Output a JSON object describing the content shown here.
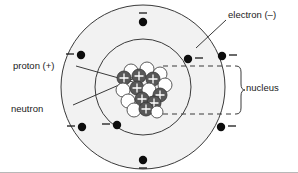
{
  "figure": {
    "background_color": "#ffffff",
    "line_color": "#3a3a3a",
    "shell_fill": "#f2f2f2"
  },
  "labels": {
    "electron": "electron (–)",
    "proton": "proton (+)",
    "neutron": "neutron",
    "nucleus": "nucleus"
  },
  "legend_symbols": {
    "electron_charge": "–",
    "proton_charge": "+",
    "neutron_charge": ""
  },
  "atom": {
    "center": {
      "x": 143,
      "y": 87
    },
    "shells": [
      {
        "name": "inner-shell",
        "radius": 48,
        "electron_count": 2
      },
      {
        "name": "outer-shell",
        "radius": 82,
        "electron_count": 6
      }
    ],
    "electrons": [
      {
        "id": "electron-inner-right",
        "shell": "inner-shell",
        "x": 188,
        "y": 59,
        "sign": "–",
        "sign_position": "right"
      },
      {
        "id": "electron-inner-left",
        "shell": "inner-shell",
        "x": 117,
        "y": 125,
        "sign": "–",
        "sign_position": "left"
      },
      {
        "id": "electron-outer-top",
        "shell": "outer-shell",
        "x": 143,
        "y": 22,
        "sign": "–",
        "sign_position": "top"
      },
      {
        "id": "electron-outer-upper-left",
        "shell": "outer-shell",
        "x": 81,
        "y": 55,
        "sign": "–",
        "sign_position": "left"
      },
      {
        "id": "electron-outer-right",
        "shell": "outer-shell",
        "x": 222,
        "y": 56,
        "sign": "–",
        "sign_position": "right"
      },
      {
        "id": "electron-outer-lower-left",
        "shell": "outer-shell",
        "x": 82,
        "y": 127,
        "sign": "–",
        "sign_position": "left"
      },
      {
        "id": "electron-outer-lower-right",
        "shell": "outer-shell",
        "x": 221,
        "y": 127,
        "sign": "–",
        "sign_position": "right"
      },
      {
        "id": "electron-outer-bottom",
        "shell": "outer-shell",
        "x": 143,
        "y": 160,
        "sign": "–",
        "sign_position": "bottom"
      }
    ],
    "nucleus": {
      "proton_color": "#585858",
      "neutron_color": "#ffffff",
      "outline_color": "#4a4a4a",
      "proton_symbol": "+",
      "proton_count": 8,
      "neutron_count": 9,
      "particles": [
        {
          "type": "neutron",
          "x": 131,
          "y": 71,
          "r": 7
        },
        {
          "type": "neutron",
          "x": 147,
          "y": 69,
          "r": 7
        },
        {
          "type": "neutron",
          "x": 160,
          "y": 74,
          "r": 7
        },
        {
          "type": "proton",
          "x": 124,
          "y": 78,
          "r": 7
        },
        {
          "type": "proton",
          "x": 139,
          "y": 76,
          "r": 7
        },
        {
          "type": "proton",
          "x": 153,
          "y": 79,
          "r": 7
        },
        {
          "type": "neutron",
          "x": 165,
          "y": 85,
          "r": 7
        },
        {
          "type": "neutron",
          "x": 123,
          "y": 90,
          "r": 7
        },
        {
          "type": "proton",
          "x": 137,
          "y": 88,
          "r": 7
        },
        {
          "type": "neutron",
          "x": 149,
          "y": 90,
          "r": 7
        },
        {
          "type": "proton",
          "x": 160,
          "y": 95,
          "r": 7
        },
        {
          "type": "neutron",
          "x": 128,
          "y": 101,
          "r": 7
        },
        {
          "type": "proton",
          "x": 142,
          "y": 99,
          "r": 7
        },
        {
          "type": "proton",
          "x": 154,
          "y": 103,
          "r": 7
        },
        {
          "type": "neutron",
          "x": 134,
          "y": 110,
          "r": 7
        },
        {
          "type": "proton",
          "x": 146,
          "y": 109,
          "r": 7
        },
        {
          "type": "neutron",
          "x": 157,
          "y": 112,
          "r": 6
        }
      ]
    }
  },
  "annotations": {
    "nucleus_bracket": {
      "dashed_line_top_y": 66,
      "dashed_line_bottom_y": 114,
      "dash_start_x": 163,
      "dash_end_x": 236,
      "brace_x": 239
    },
    "leaders": [
      {
        "id": "leader-electron",
        "from": [
          226,
          20
        ],
        "to": [
          196,
          48
        ]
      },
      {
        "id": "leader-proton",
        "from": [
          75,
          66
        ],
        "to": [
          139,
          83
        ]
      },
      {
        "id": "leader-neutron",
        "from": [
          72,
          105
        ],
        "to": [
          134,
          78
        ]
      }
    ]
  }
}
